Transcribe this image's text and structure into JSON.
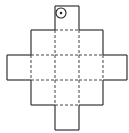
{
  "diagram": {
    "type": "net",
    "grid": {
      "x": [
        7,
        31,
        55,
        79,
        103,
        127
      ],
      "y": [
        6,
        30,
        55,
        80,
        105,
        130
      ]
    },
    "cells": [
      {
        "row": 0,
        "col": 2,
        "marker": "dot-circle"
      },
      {
        "row": 1,
        "col": 1
      },
      {
        "row": 1,
        "col": 2
      },
      {
        "row": 1,
        "col": 3
      },
      {
        "row": 2,
        "col": 0
      },
      {
        "row": 2,
        "col": 1
      },
      {
        "row": 2,
        "col": 2
      },
      {
        "row": 2,
        "col": 3
      },
      {
        "row": 2,
        "col": 4
      },
      {
        "row": 3,
        "col": 1
      },
      {
        "row": 3,
        "col": 2
      },
      {
        "row": 3,
        "col": 3
      },
      {
        "row": 4,
        "col": 2
      }
    ],
    "marker": {
      "cx": 61,
      "cy": 13,
      "r": 5,
      "dot_r": 1.3,
      "color": "#222222"
    },
    "line_colors": {
      "solid": "#333333",
      "dashed": "#444444"
    }
  }
}
